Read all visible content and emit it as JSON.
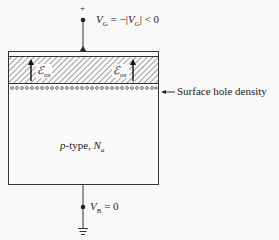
{
  "gate": {
    "polarity": "+",
    "voltage_label_var": "V",
    "voltage_label_sub": "G",
    "voltage_label_rest": " = −|",
    "voltage_label_var2": "V",
    "voltage_label_sub2": "G",
    "voltage_label_end": "| < 0"
  },
  "oxide": {
    "field_symbol": "ℰ",
    "field_sub": "ox"
  },
  "annotation": {
    "surface_label": "Surface hole density"
  },
  "substrate": {
    "type_italic": "p",
    "type_text": "-type, ",
    "doping_var": "N",
    "doping_sub": "a"
  },
  "body": {
    "voltage_var": "V",
    "voltage_sub": "B",
    "voltage_rest": " = 0"
  },
  "colors": {
    "line": "#333333",
    "background": "#f8f8f8",
    "hatch": "#555555"
  }
}
